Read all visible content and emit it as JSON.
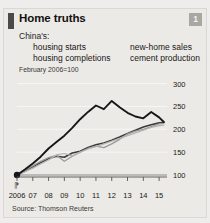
{
  "card": {
    "title": "Home truths",
    "badge": "1",
    "subtitle": "China's:",
    "note": "February 2006=100",
    "source": "Source: Thomson Reuters"
  },
  "colors": {
    "accent_bar": "#4a4a48",
    "badge_bg": "#a9a7a3",
    "panel_bg": "#eceae7",
    "housing_starts": "#3a3a3a",
    "new_home_sales": "#9a9a9a",
    "housing_completions": "#b5b3b0",
    "cement_production": "#17171a",
    "gridline": "#f7f6f4",
    "baseline": "#8d8b88"
  },
  "chart_data": {
    "type": "line",
    "title": "Home truths",
    "subtitle": "China's:",
    "note": "February 2006=100",
    "xlabel": "",
    "ylabel": "",
    "xlim": [
      2006,
      2015.5
    ],
    "ylim": [
      90,
      310
    ],
    "grid": true,
    "legend_position": "above-plot",
    "x_ticks": [
      2006,
      2007,
      2008,
      2009,
      2010,
      2011,
      2012,
      2013,
      2014,
      2015
    ],
    "x_tick_labels": [
      "2006",
      "07",
      "08",
      "09",
      "10",
      "11",
      "12",
      "13",
      "14",
      "15"
    ],
    "y_ticks": [
      100,
      150,
      200,
      250,
      300
    ],
    "y_tick_labels": [
      "100",
      "150",
      "200",
      "250",
      "300"
    ],
    "axis_break": true,
    "origin_marker": {
      "x": 2006,
      "y": 100
    },
    "x": [
      2006,
      2006.5,
      2007,
      2007.5,
      2008,
      2008.5,
      2009,
      2009.5,
      2010,
      2010.5,
      2011,
      2011.5,
      2012,
      2012.5,
      2013,
      2013.5,
      2014,
      2014.5,
      2015,
      2015.3
    ],
    "series": [
      {
        "name": "housing starts",
        "color": "#3a3a3a",
        "width": 1.6,
        "values": [
          100,
          108,
          118,
          127,
          136,
          141,
          139,
          148,
          152,
          160,
          166,
          170,
          176,
          183,
          191,
          198,
          205,
          210,
          214,
          215
        ]
      },
      {
        "name": "new-home sales",
        "color": "#9a9a9a",
        "width": 1.3,
        "values": [
          100,
          110,
          120,
          130,
          138,
          143,
          130,
          141,
          150,
          158,
          163,
          160,
          168,
          178,
          190,
          196,
          200,
          206,
          212,
          213
        ]
      },
      {
        "name": "housing completions",
        "color": "#b5b3b0",
        "width": 1.2,
        "values": [
          100,
          107,
          115,
          124,
          133,
          144,
          147,
          142,
          150,
          157,
          162,
          168,
          174,
          180,
          186,
          192,
          198,
          204,
          208,
          209
        ]
      },
      {
        "name": "cement production",
        "color": "#17171a",
        "width": 1.9,
        "values": [
          100,
          112,
          125,
          140,
          158,
          172,
          186,
          203,
          222,
          238,
          252,
          244,
          262,
          248,
          236,
          228,
          224,
          238,
          226,
          216
        ]
      }
    ]
  }
}
